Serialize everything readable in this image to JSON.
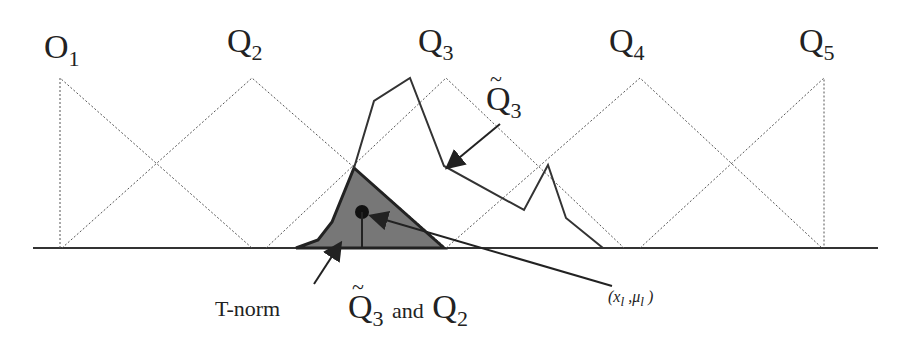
{
  "labels": {
    "o1": {
      "base": "O",
      "sub": "1"
    },
    "q2": {
      "base": "Q",
      "sub": "2"
    },
    "q3": {
      "base": "Q",
      "sub": "3"
    },
    "q4": {
      "base": "Q",
      "sub": "4"
    },
    "q5": {
      "base": "Q",
      "sub": "5"
    },
    "q3_tilde": {
      "base": "Q",
      "sub": "3"
    },
    "tnorm": "T-norm",
    "caption_q3": {
      "base": "Q",
      "sub": "3"
    },
    "caption_and": "and",
    "caption_q2": {
      "base": "Q",
      "sub": "2"
    },
    "point": "(x",
    "point_sub1": "l",
    "point_mid": " ,μ",
    "point_sub2": "l",
    "point_end": " )"
  },
  "colors": {
    "line": "#222222",
    "fill": "#6e6e6e",
    "dotted": "#555555"
  }
}
